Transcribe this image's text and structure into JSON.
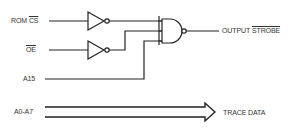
{
  "diagram": {
    "type": "logic-circuit",
    "inputs": [
      {
        "id": "rom_cs",
        "prefix": "ROM ",
        "name": "CS",
        "active_low": true
      },
      {
        "id": "oe",
        "prefix": "",
        "name": "OE",
        "active_low": true
      },
      {
        "id": "a15",
        "prefix": "",
        "name": "A15",
        "active_low": false
      }
    ],
    "bus": {
      "label": "A0-A7",
      "output_label": "TRACE DATA"
    },
    "output": {
      "prefix": "OUTPUT ",
      "name": "STROBE",
      "active_low": true
    },
    "gates": [
      {
        "type": "inverter",
        "input": "ROM CS"
      },
      {
        "type": "inverter",
        "input": "OE"
      },
      {
        "type": "nand",
        "inputs": [
          "NOT ROM CS",
          "NOT OE",
          "A15"
        ],
        "output": "OUTPUT STROBE"
      }
    ],
    "colors": {
      "line": "#222222",
      "text": "#333333",
      "background": "#ffffff"
    }
  }
}
